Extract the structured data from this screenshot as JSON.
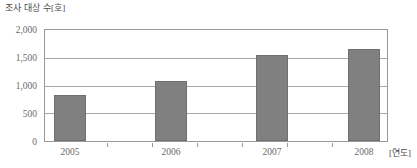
{
  "chart_data": {
    "type": "bar",
    "title": "",
    "ylabel": "조사 대상 수[호]",
    "xlabel": "[연도]",
    "categories": [
      "2005",
      "2006",
      "2007",
      "2008"
    ],
    "values": [
      830,
      1080,
      1550,
      1660
    ],
    "series": [
      {
        "name": "조사 대상 수",
        "values": [
          830,
          1080,
          1550,
          1660
        ]
      }
    ],
    "ylim": [
      0,
      2000
    ],
    "ytick_labels": [
      "0",
      "500",
      "1,000",
      "1,500",
      "2,000"
    ],
    "ytick_values": [
      0,
      500,
      1000,
      1500,
      2000
    ],
    "grid": true,
    "legend": "none",
    "bar_color": "#808080",
    "frame_color": "#9a9a9a",
    "gridline_color": "#a8a8a8",
    "text_color": "#6a6a6a"
  }
}
